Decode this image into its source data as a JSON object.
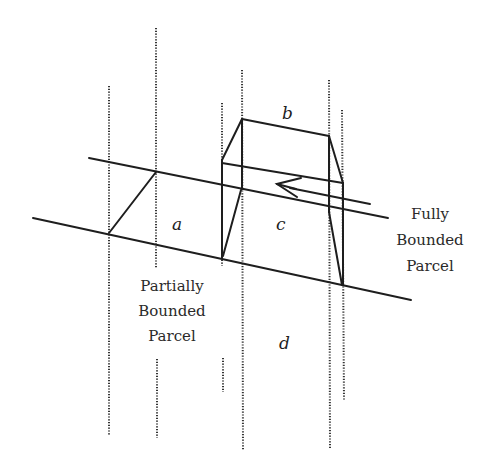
{
  "diagram": {
    "parcel_labels": {
      "a": "a",
      "b": "b",
      "c": "c",
      "d": "d"
    },
    "annotations": {
      "partially_bounded": [
        "Partially",
        "Bounded",
        "Parcel"
      ],
      "fully_bounded": [
        "Fully",
        "Bounded",
        "Parcel"
      ]
    },
    "colors": {
      "line": "#1e1e1e",
      "dotted": "#333333",
      "background": "#ffffff"
    }
  }
}
